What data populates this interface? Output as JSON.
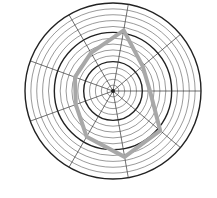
{
  "chart_data": {
    "type": "radar",
    "title": "",
    "axes_count": 9,
    "axis_angles_deg": [
      0,
      40,
      80,
      120,
      160,
      200,
      240,
      280,
      320
    ],
    "axis_labels": [],
    "rings": 15,
    "major_ring_every": 5,
    "rlim": [
      0,
      1
    ],
    "series": [
      {
        "name": "",
        "color": "#a8a8a8",
        "values": [
          0.42,
          0.44,
          0.7,
          0.5,
          0.46,
          0.45,
          0.6,
          0.76,
          0.7
        ]
      }
    ],
    "legend": []
  },
  "style": {
    "grid_color": "#555555",
    "major_grid_color": "#222222",
    "spoke_color": "#333333",
    "background": "#ffffff"
  }
}
